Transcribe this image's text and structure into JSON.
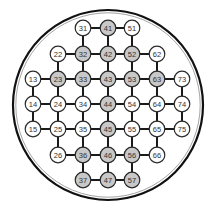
{
  "board": {
    "title": "Peg solitaire board",
    "outer_circle": {
      "cx": 108,
      "cy": 105,
      "r": 95,
      "stroke": "#111111",
      "inner_stroke": "#9a9a9a"
    },
    "colors": {
      "filled": "#c8c8c8",
      "empty": "#ffffff",
      "node_stroke": "#2a2a2a",
      "edge": "#1a1a1a"
    },
    "columns_x": {
      "1": 33,
      "2": 58,
      "3": 83,
      "4": 108,
      "5": 132,
      "6": 157,
      "7": 182
    },
    "rows_y": {
      "1": 28,
      "2": 54,
      "3": 79,
      "4": 104,
      "5": 129,
      "6": 155,
      "7": 180
    },
    "nodes": [
      {
        "id": "31",
        "filled": false
      },
      {
        "id": "41",
        "filled": true
      },
      {
        "id": "51",
        "filled": false
      },
      {
        "id": "22",
        "filled": false
      },
      {
        "id": "32",
        "filled": true
      },
      {
        "id": "42",
        "filled": true
      },
      {
        "id": "52",
        "filled": true
      },
      {
        "id": "62",
        "filled": false
      },
      {
        "id": "13",
        "filled": false
      },
      {
        "id": "23",
        "filled": true
      },
      {
        "id": "33",
        "filled": true
      },
      {
        "id": "43",
        "filled": true
      },
      {
        "id": "53",
        "filled": true
      },
      {
        "id": "63",
        "filled": true
      },
      {
        "id": "73",
        "filled": false
      },
      {
        "id": "14",
        "filled": false
      },
      {
        "id": "24",
        "filled": false
      },
      {
        "id": "34",
        "filled": false
      },
      {
        "id": "44",
        "filled": true
      },
      {
        "id": "54",
        "filled": false
      },
      {
        "id": "64",
        "filled": false
      },
      {
        "id": "74",
        "filled": false
      },
      {
        "id": "15",
        "filled": false
      },
      {
        "id": "25",
        "filled": false
      },
      {
        "id": "35",
        "filled": false
      },
      {
        "id": "45",
        "filled": true
      },
      {
        "id": "55",
        "filled": false
      },
      {
        "id": "65",
        "filled": false
      },
      {
        "id": "75",
        "filled": false
      },
      {
        "id": "26",
        "filled": false
      },
      {
        "id": "36",
        "filled": true
      },
      {
        "id": "46",
        "filled": true
      },
      {
        "id": "56",
        "filled": true
      },
      {
        "id": "66",
        "filled": false
      },
      {
        "id": "37",
        "filled": true
      },
      {
        "id": "47",
        "filled": true
      },
      {
        "id": "57",
        "filled": true
      }
    ]
  }
}
